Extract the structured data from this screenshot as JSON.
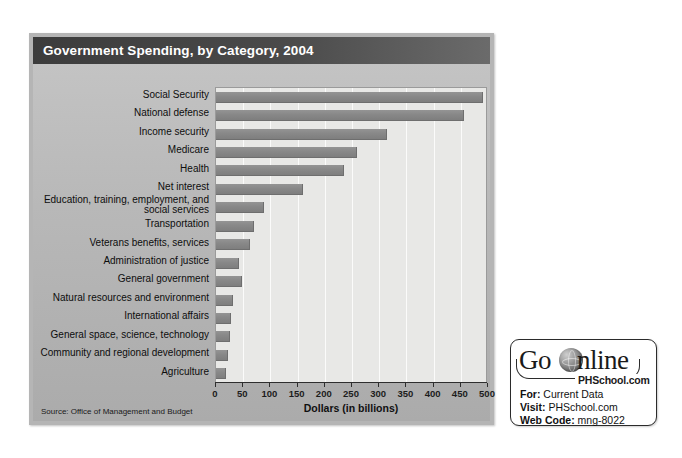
{
  "figure": {
    "title": "Government Spending, by Category, 2004",
    "source": "Source: Office of Management and Budget"
  },
  "chart_data": {
    "type": "bar",
    "orientation": "horizontal",
    "title": "Government Spending, by Category, 2004",
    "xlabel": "Dollars (in billions)",
    "ylabel": "",
    "xlim": [
      0,
      500
    ],
    "xticks": [
      0,
      50,
      100,
      150,
      200,
      250,
      300,
      350,
      400,
      450,
      500
    ],
    "xtick_labels": [
      "0",
      "50",
      "100",
      "150",
      "200",
      "250",
      "300",
      "350",
      "400",
      "450",
      "500"
    ],
    "grid": true,
    "grid_axis": "x",
    "legend": false,
    "bar_color": "#888888",
    "plot_background": "#e8e8e6",
    "categories": [
      "Social Security",
      "National defense",
      "Income security",
      "Medicare",
      "Health",
      "Net interest",
      "Education, training, employment, and social services",
      "Transportation",
      "Veterans benefits, services",
      "Administration of justice",
      "General government",
      "Natural resources and environment",
      "International affairs",
      "General space,  science, technology",
      "Community and regional development",
      "Agriculture"
    ],
    "values": [
      490,
      455,
      315,
      260,
      235,
      160,
      88,
      70,
      62,
      42,
      48,
      32,
      28,
      26,
      22,
      18
    ],
    "source": "Source: Office of Management and Budget"
  },
  "categories_display": [
    {
      "label": "Social Security",
      "two_line": false
    },
    {
      "label": "National defense",
      "two_line": false
    },
    {
      "label": "Income security",
      "two_line": false
    },
    {
      "label": "Medicare",
      "two_line": false
    },
    {
      "label": "Health",
      "two_line": false
    },
    {
      "label": "Net interest",
      "two_line": false
    },
    {
      "label": "Education, training, employment, and social services",
      "two_line": true
    },
    {
      "label": "Transportation",
      "two_line": false
    },
    {
      "label": "Veterans benefits, services",
      "two_line": false
    },
    {
      "label": "Administration of justice",
      "two_line": false
    },
    {
      "label": "General government",
      "two_line": false
    },
    {
      "label": "Natural resources and environment",
      "two_line": false
    },
    {
      "label": "International affairs",
      "two_line": false
    },
    {
      "label": "General space,  science, technology",
      "two_line": false
    },
    {
      "label": "Community and regional development",
      "two_line": false
    },
    {
      "label": "Agriculture",
      "two_line": false
    }
  ],
  "go_online": {
    "logo_go": "Go",
    "logo_online": "nline",
    "tagline": "PHSchool.com",
    "for_label": "For:",
    "for_value": "Current Data",
    "visit_label": "Visit:",
    "visit_value": "PHSchool.com",
    "code_label": "Web Code:",
    "code_value": "mng-8022"
  }
}
